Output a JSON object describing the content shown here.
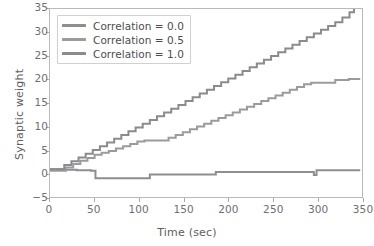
{
  "chart_data": {
    "type": "line",
    "title": "",
    "xlabel": "Time (sec)",
    "ylabel": "Synaptic weight",
    "xlim": [
      0,
      350
    ],
    "ylim": [
      -5,
      35
    ],
    "xticks": [
      0,
      50,
      100,
      150,
      200,
      250,
      300,
      350
    ],
    "yticks": [
      -5,
      0,
      5,
      10,
      15,
      20,
      25,
      30,
      35
    ],
    "grid": false,
    "legend_position": "upper left",
    "drawstyle": "steps-post",
    "series": [
      {
        "name": "Correlation = 0.0",
        "color": "#8d8d92",
        "x": [
          0,
          6,
          14,
          22,
          30,
          38,
          46,
          51,
          60,
          75,
          90,
          100,
          110,
          112,
          130,
          150,
          170,
          183,
          186,
          210,
          240,
          270,
          293,
          296,
          299,
          310,
          325,
          340,
          348
        ],
        "y": [
          0.9,
          0.9,
          0.8,
          0.8,
          0.7,
          0.7,
          0.6,
          -1.0,
          -1.0,
          -1.0,
          -1.0,
          -1.0,
          -1.0,
          -0.2,
          -0.2,
          -0.2,
          -0.2,
          -0.2,
          0.3,
          0.3,
          0.3,
          0.3,
          0.3,
          -0.3,
          0.7,
          0.7,
          0.7,
          0.7,
          0.7
        ]
      },
      {
        "name": "Correlation = 0.5",
        "color": "#9a9a9f",
        "x": [
          0,
          10,
          18,
          26,
          34,
          42,
          50,
          58,
          66,
          74,
          82,
          90,
          98,
          106,
          112,
          126,
          133,
          141,
          149,
          157,
          165,
          173,
          181,
          189,
          197,
          205,
          213,
          221,
          229,
          237,
          245,
          253,
          261,
          269,
          277,
          285,
          293,
          300,
          312,
          320,
          335,
          348
        ],
        "y": [
          0.6,
          0.6,
          1.3,
          2.0,
          2.7,
          3.3,
          4.0,
          4.4,
          4.8,
          5.3,
          5.8,
          6.3,
          6.8,
          7.0,
          7.0,
          7.0,
          7.6,
          8.2,
          8.8,
          9.4,
          10.0,
          10.6,
          11.2,
          11.8,
          12.4,
          13.0,
          13.6,
          14.2,
          14.8,
          15.4,
          16.0,
          16.6,
          17.2,
          17.8,
          18.4,
          19.0,
          19.3,
          19.3,
          19.3,
          19.9,
          20.1,
          20.1
        ]
      },
      {
        "name": "Correlation = 1.0",
        "color": "#8a8a8f",
        "x": [
          0,
          8,
          16,
          24,
          32,
          40,
          48,
          56,
          64,
          72,
          80,
          88,
          96,
          104,
          112,
          120,
          128,
          136,
          144,
          152,
          160,
          168,
          176,
          184,
          192,
          200,
          208,
          216,
          224,
          232,
          240,
          248,
          256,
          264,
          272,
          280,
          288,
          296,
          304,
          312,
          320,
          328,
          336,
          341
        ],
        "y": [
          0.9,
          0.9,
          1.8,
          2.6,
          3.4,
          4.2,
          5.0,
          5.8,
          6.6,
          7.4,
          8.2,
          9.0,
          9.8,
          10.6,
          11.4,
          12.2,
          13.0,
          13.8,
          14.6,
          15.4,
          16.2,
          17.0,
          17.8,
          18.6,
          19.4,
          20.2,
          21.0,
          21.8,
          22.6,
          23.4,
          24.2,
          25.0,
          25.8,
          26.6,
          27.4,
          28.2,
          29.0,
          29.8,
          30.6,
          31.4,
          32.2,
          33.2,
          34.3,
          35.0
        ]
      }
    ]
  },
  "axes": {
    "frame_color": "#b9b9bd",
    "tick_color": "#a9a9ae",
    "label_color": "#5d5d63"
  }
}
